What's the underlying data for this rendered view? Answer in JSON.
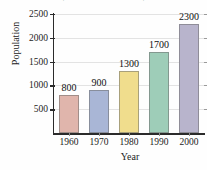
{
  "chart_data": {
    "type": "bar",
    "title": "(in millions of residents)",
    "title_clipped": true,
    "xlabel": "Year",
    "ylabel": "Population",
    "categories": [
      "1960",
      "1970",
      "1980",
      "1990",
      "2000"
    ],
    "values": [
      800,
      900,
      1300,
      1700,
      2300
    ],
    "data_labels": [
      "800",
      "900",
      "1300",
      "1700",
      "2300"
    ],
    "ylim": [
      0,
      2500
    ],
    "yticks": [
      500,
      1000,
      1500,
      2000,
      2500
    ],
    "ytick_labels": [
      "500",
      "1000",
      "1500",
      "2000",
      "2500"
    ],
    "grid": true,
    "legend": "none",
    "bar_colors": [
      "#e0b5ac",
      "#a9b6d6",
      "#f0dd8d",
      "#9ecdb8",
      "#b8b4cc"
    ],
    "bar_edge_color": "#6e6e6e",
    "axis_color": "#2b2b2b",
    "grid_color": "#e3e3e3",
    "background": "#fefefe"
  }
}
